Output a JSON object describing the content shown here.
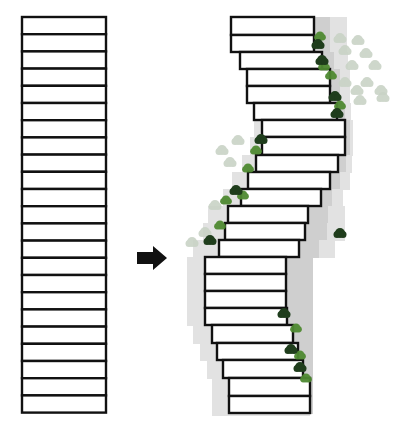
{
  "figure": {
    "left_stack": {
      "label": "original-stack",
      "x": 22,
      "width": 84,
      "top": 17,
      "slab_height": 17.2,
      "count": 23
    },
    "arrow": {
      "direction": "right",
      "label": "transform-arrow"
    },
    "right_stack": {
      "label": "shifted-stack",
      "slabs": [
        {
          "y": 17,
          "h": 18,
          "x1": 231,
          "x2": 314
        },
        {
          "y": 35,
          "h": 17,
          "x1": 231,
          "x2": 314
        },
        {
          "y": 52,
          "h": 17,
          "x1": 240,
          "x2": 322
        },
        {
          "y": 69,
          "h": 17,
          "x1": 247,
          "x2": 330
        },
        {
          "y": 86,
          "h": 17,
          "x1": 247,
          "x2": 330
        },
        {
          "y": 103,
          "h": 17,
          "x1": 254,
          "x2": 337
        },
        {
          "y": 120,
          "h": 17,
          "x1": 262,
          "x2": 345
        },
        {
          "y": 137,
          "h": 18,
          "x1": 262,
          "x2": 345
        },
        {
          "y": 155,
          "h": 17,
          "x1": 256,
          "x2": 338
        },
        {
          "y": 172,
          "h": 17,
          "x1": 248,
          "x2": 330
        },
        {
          "y": 189,
          "h": 17,
          "x1": 241,
          "x2": 321
        },
        {
          "y": 206,
          "h": 17,
          "x1": 228,
          "x2": 308
        },
        {
          "y": 223,
          "h": 17,
          "x1": 225,
          "x2": 305
        },
        {
          "y": 240,
          "h": 17,
          "x1": 219,
          "x2": 299
        },
        {
          "y": 257,
          "h": 17,
          "x1": 205,
          "x2": 286
        },
        {
          "y": 274,
          "h": 17,
          "x1": 205,
          "x2": 286
        },
        {
          "y": 291,
          "h": 17,
          "x1": 205,
          "x2": 286
        },
        {
          "y": 308,
          "h": 17,
          "x1": 205,
          "x2": 287
        },
        {
          "y": 325,
          "h": 18,
          "x1": 212,
          "x2": 293
        },
        {
          "y": 343,
          "h": 17,
          "x1": 217,
          "x2": 298
        },
        {
          "y": 360,
          "h": 18,
          "x1": 223,
          "x2": 303
        },
        {
          "y": 378,
          "h": 18,
          "x1": 229,
          "x2": 310
        },
        {
          "y": 396,
          "h": 17,
          "x1": 229,
          "x2": 310
        }
      ]
    },
    "colors": {
      "outline": "#111111",
      "slab_fill": "#ffffff",
      "shadow_dark": "#cfcfcf",
      "shadow_light": "#e2e2e2",
      "plant_dark": "#1f3d1c",
      "plant_mid": "#4f8a32",
      "plant_light": "#8cc06a",
      "plant_faded": "#c9d3c6"
    },
    "plants": {
      "dark": [
        [
          318,
          44
        ],
        [
          322,
          60
        ],
        [
          261,
          139
        ],
        [
          236,
          190
        ],
        [
          210,
          240
        ],
        [
          284,
          313
        ],
        [
          291,
          349
        ],
        [
          300,
          367
        ],
        [
          335,
          96
        ],
        [
          337,
          113
        ],
        [
          340,
          233
        ]
      ],
      "mid": [
        [
          320,
          36
        ],
        [
          324,
          66
        ],
        [
          331,
          75
        ],
        [
          256,
          150
        ],
        [
          248,
          168
        ],
        [
          243,
          195
        ],
        [
          220,
          225
        ],
        [
          226,
          200
        ],
        [
          296,
          328
        ],
        [
          300,
          355
        ],
        [
          306,
          378
        ],
        [
          340,
          105
        ]
      ],
      "faded": [
        [
          340,
          38
        ],
        [
          358,
          40
        ],
        [
          345,
          50
        ],
        [
          366,
          53
        ],
        [
          352,
          65
        ],
        [
          375,
          65
        ],
        [
          345,
          82
        ],
        [
          367,
          82
        ],
        [
          357,
          90
        ],
        [
          381,
          90
        ],
        [
          383,
          97
        ],
        [
          360,
          100
        ],
        [
          238,
          140
        ],
        [
          230,
          162
        ],
        [
          215,
          205
        ],
        [
          192,
          242
        ],
        [
          205,
          232
        ],
        [
          222,
          150
        ]
      ]
    }
  }
}
